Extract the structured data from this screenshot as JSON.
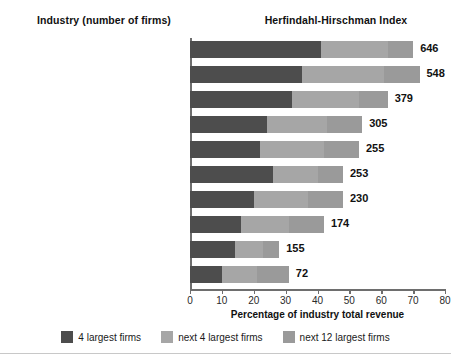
{
  "header": {
    "industry_column": "Industry (number of firms)",
    "index_column": "Herfindahl-Hirschman Index"
  },
  "axis": {
    "xlabel": "Percentage of industry total revenue",
    "ticks": [
      "0",
      "10",
      "20",
      "30",
      "40",
      "50",
      "60",
      "70",
      "80"
    ]
  },
  "legend": [
    {
      "label": "4 largest firms",
      "color": "#4d4d4d"
    },
    {
      "label": "next 4 largest firms",
      "color": "#a6a6a6"
    },
    {
      "label": "next 12 largest firms",
      "color": "#9a9a9a"
    }
  ],
  "chart_data": {
    "type": "bar",
    "orientation": "horizontal",
    "stacked": true,
    "title": "Herfindahl-Hirschman Index",
    "xlabel": "Percentage of industry total revenue",
    "ylabel": "Industry (number of firms)",
    "xlim": [
      0,
      80
    ],
    "grid": false,
    "legend_position": "bottom",
    "categories": [
      "Audio and video equipment (478)",
      "Cheese (341)",
      "Book printing (558)",
      "Frozen food (499)",
      "Canned foods (537)",
      "Sporting goods (1,808)",
      "Jewelry (2,538)",
      "Women's and girls' clothing (1,103)",
      "Furniture (6,314)",
      "Men's and boys' clothing (929)"
    ],
    "series": [
      {
        "name": "4 largest firms",
        "values": [
          41,
          35,
          32,
          24,
          22,
          26,
          20,
          16,
          14,
          10
        ]
      },
      {
        "name": "next 4 largest firms",
        "values": [
          21,
          26,
          21,
          19,
          20,
          14,
          17,
          15,
          9,
          11
        ]
      },
      {
        "name": "next 12 largest firms",
        "values": [
          8,
          11,
          9,
          11,
          11,
          8,
          11,
          11,
          5,
          10
        ]
      }
    ],
    "value_labels": [
      646,
      548,
      379,
      305,
      255,
      253,
      230,
      174,
      155,
      72
    ],
    "value_label_name": "Herfindahl-Hirschman Index"
  }
}
